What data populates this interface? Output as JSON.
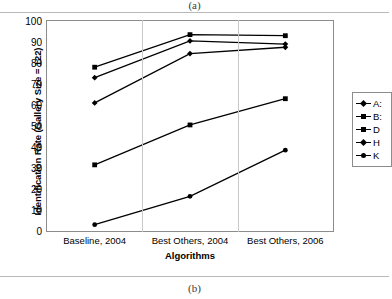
{
  "figure": {
    "caption_top": "(a)",
    "caption_bottom": "(b)"
  },
  "chart_data": {
    "type": "line",
    "title": "",
    "xlabel": "Algorithms",
    "ylabel": "Identification Rate (Gallery Size = 122)",
    "categories": [
      "Baseline, 2004",
      "Best Others, 2004",
      "Best Others, 2006"
    ],
    "ylim": [
      0,
      100
    ],
    "yticks": [
      0,
      10,
      20,
      30,
      40,
      50,
      60,
      70,
      80,
      90,
      100
    ],
    "grid": false,
    "legend_position": "right",
    "series": [
      {
        "name": "A:",
        "marker": "diamond",
        "values": [
          73,
          90.5,
          89
        ]
      },
      {
        "name": "B:",
        "marker": "square",
        "values": [
          78,
          93.5,
          93
        ]
      },
      {
        "name": "D",
        "marker": "square",
        "values": [
          31.5,
          50.5,
          63
        ]
      },
      {
        "name": "H",
        "marker": "diamond",
        "values": [
          61,
          84.5,
          87.5
        ]
      },
      {
        "name": "K",
        "marker": "circle",
        "values": [
          3,
          16.5,
          38.5
        ]
      }
    ]
  }
}
